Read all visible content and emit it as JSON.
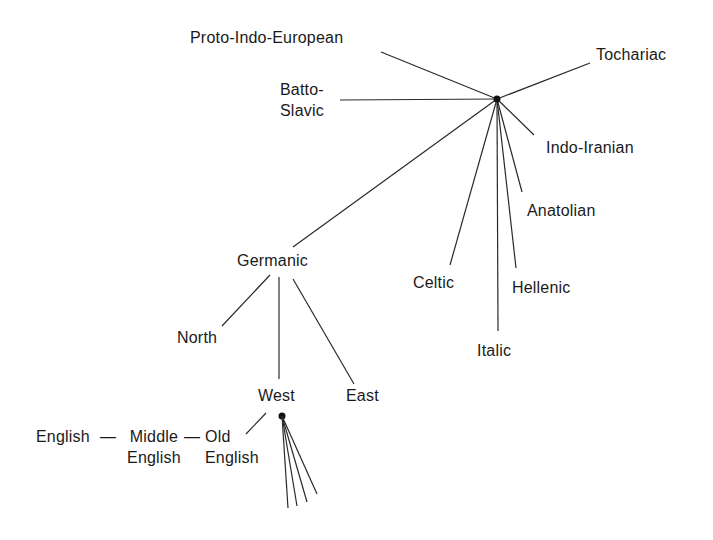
{
  "labels": {
    "pie": "Proto-Indo-European",
    "tocharian": "Tochariac",
    "balto1": "Batto-",
    "balto2": "Slavic",
    "indoiranian": "Indo-Iranian",
    "anatolian": "Anatolian",
    "germanic": "Germanic",
    "celtic": "Celtic",
    "hellenic": "Hellenic",
    "italic": "Italic",
    "north": "North",
    "east": "East",
    "west": "West",
    "english": "English",
    "dash1": "—",
    "middle1": "Middle",
    "middle2": "English",
    "dash2": "—",
    "old1": "Old",
    "old2": "English"
  },
  "nodes": {
    "pie_root": {
      "x": 497,
      "y": 99
    },
    "west_root": {
      "x": 282,
      "y": 416
    }
  }
}
